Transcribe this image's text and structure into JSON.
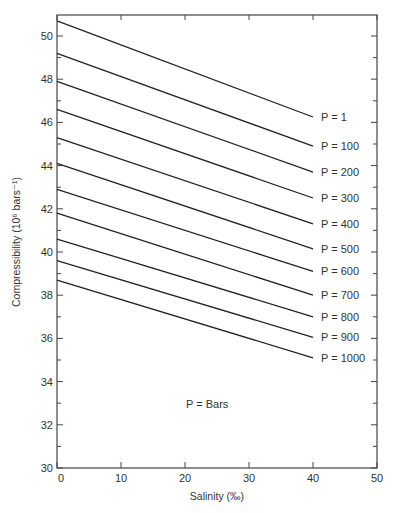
{
  "chart_data": {
    "type": "line",
    "title": "",
    "xlabel": "Salinity (‰)",
    "ylabel": "Compressibility (10⁶ bars⁻¹)",
    "xlim": [
      0,
      50
    ],
    "ylim": [
      30,
      51
    ],
    "x_ticks": [
      0,
      10,
      20,
      30,
      40,
      50
    ],
    "y_ticks": [
      30,
      32,
      34,
      36,
      38,
      40,
      42,
      44,
      46,
      48,
      50
    ],
    "grid": false,
    "annotation": "P = Bars",
    "x": [
      0,
      40
    ],
    "series": [
      {
        "name": "P = 1",
        "values": [
          50.7,
          46.25
        ]
      },
      {
        "name": "P = 100",
        "values": [
          49.2,
          44.9
        ]
      },
      {
        "name": "P = 200",
        "values": [
          47.9,
          43.7
        ]
      },
      {
        "name": "P = 300",
        "values": [
          46.6,
          42.5
        ]
      },
      {
        "name": "P = 400",
        "values": [
          45.3,
          41.3
        ]
      },
      {
        "name": "P = 500",
        "values": [
          44.1,
          40.15
        ]
      },
      {
        "name": "P = 600",
        "values": [
          42.9,
          39.1
        ]
      },
      {
        "name": "P = 700",
        "values": [
          41.8,
          38.0
        ]
      },
      {
        "name": "P = 800",
        "values": [
          40.6,
          37.0
        ]
      },
      {
        "name": "P = 900",
        "values": [
          39.6,
          36.05
        ]
      },
      {
        "name": "P = 1000",
        "values": [
          38.7,
          35.1
        ]
      }
    ]
  }
}
